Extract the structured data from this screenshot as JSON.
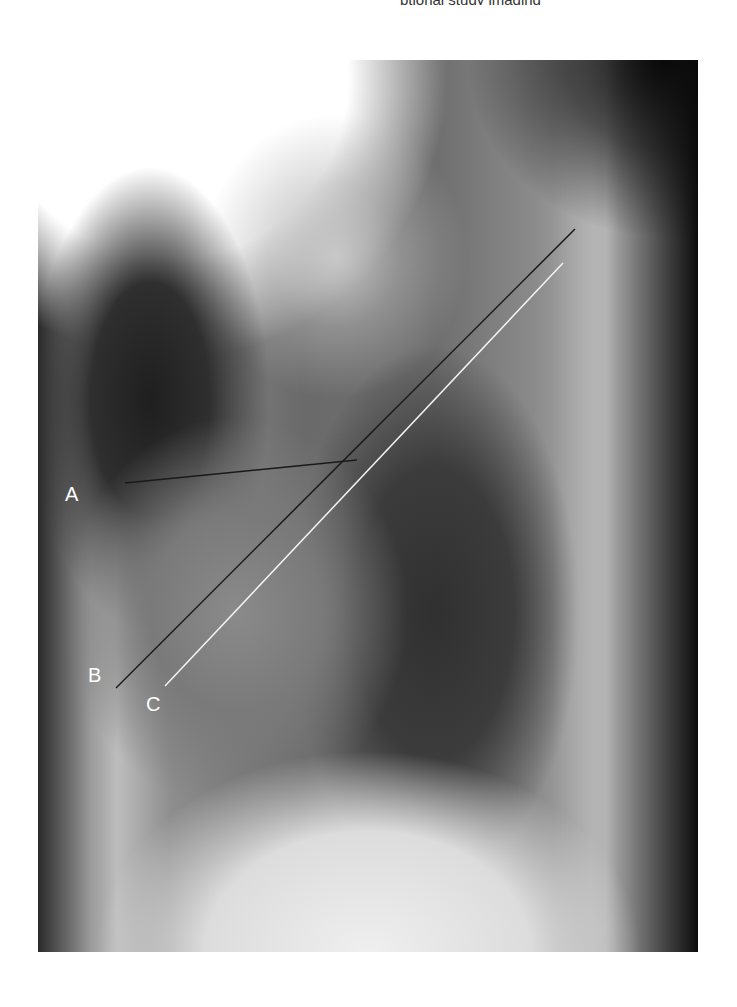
{
  "figure": {
    "top_caption_fragment": "ptional study imaging",
    "labels": [
      {
        "id": "A",
        "text": "A",
        "x": 65,
        "y": 484,
        "color": "#ffffff"
      },
      {
        "id": "B",
        "text": "B",
        "x": 88,
        "y": 665,
        "color": "#ffffff"
      },
      {
        "id": "C",
        "text": "C",
        "x": 146,
        "y": 694,
        "color": "#ffffff"
      }
    ],
    "lines": [
      {
        "id": "line-a",
        "x1": 125,
        "y1": 483,
        "x2": 357,
        "y2": 460,
        "color": "#1a1a1a"
      },
      {
        "id": "line-b",
        "x1": 116,
        "y1": 688,
        "x2": 575,
        "y2": 229,
        "color": "#1a1a1a"
      },
      {
        "id": "line-c",
        "x1": 165,
        "y1": 686,
        "x2": 563,
        "y2": 263,
        "color": "#f4f4f4"
      }
    ]
  }
}
